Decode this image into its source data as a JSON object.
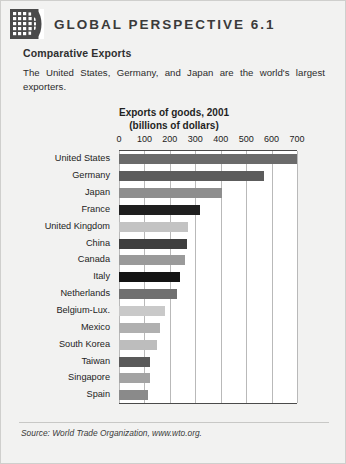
{
  "header": {
    "title": "GLOBAL PERSPECTIVE 6.1",
    "icon": "globe-grid-icon"
  },
  "intro": {
    "subtitle": "Comparative Exports",
    "blurb": "The United States, Germany, and Japan are the world's largest exporters."
  },
  "source": {
    "text": "Source: World Trade Organization, www.wto.org."
  },
  "chart_data": {
    "type": "bar",
    "orientation": "horizontal",
    "title": "Exports of goods, 2001",
    "subtitle": "(billions of dollars)",
    "xlabel": "",
    "ylabel": "",
    "xlim": [
      0,
      700
    ],
    "xticks": [
      0,
      100,
      200,
      300,
      400,
      500,
      600,
      700
    ],
    "tick_labels": [
      "0",
      "100",
      "200",
      "300",
      "400",
      "500",
      "600",
      "700"
    ],
    "grid": true,
    "legend": "none",
    "categories": [
      "United States",
      "Germany",
      "Japan",
      "France",
      "United Kingdom",
      "China",
      "Canada",
      "Italy",
      "Netherlands",
      "Belgium-Lux.",
      "Mexico",
      "South Korea",
      "Taiwan",
      "Singapore",
      "Spain"
    ],
    "values": [
      730,
      570,
      405,
      320,
      270,
      266,
      260,
      240,
      230,
      180,
      160,
      150,
      123,
      122,
      115
    ],
    "bar_colors": [
      "#6b6b6b",
      "#5c5c5c",
      "#8e8e8e",
      "#1f1f1f",
      "#c3c3c3",
      "#3f3f3f",
      "#9a9a9a",
      "#141414",
      "#707070",
      "#c9c9c9",
      "#b0b0b0",
      "#bdbdbd",
      "#5a5a5a",
      "#a3a3a3",
      "#8a8a8a"
    ]
  },
  "colors": {
    "page_background": "#f2f2f1",
    "plot_background": "#ffffff",
    "gridline": "#b9b9b9",
    "axis": "#4a4a4a",
    "text": "#2b2b2b"
  }
}
